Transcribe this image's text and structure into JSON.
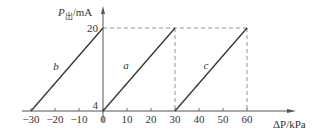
{
  "chart_data": {
    "type": "line",
    "title": "",
    "xlabel": "ΔP/kPa",
    "ylabel": "P出/mA",
    "ylabel_main": "P",
    "ylabel_sub": "出",
    "ylabel_unit": "/mA",
    "xlim": [
      -35,
      70
    ],
    "ylim": [
      4,
      20
    ],
    "x_ticks": [
      -30,
      -20,
      -10,
      0,
      10,
      20,
      30,
      40,
      50,
      60
    ],
    "x_tick_labels": [
      "−30",
      "−20",
      "−10",
      "0",
      "10",
      "20",
      "30",
      "40",
      "50",
      "60"
    ],
    "y_ticks": [
      4,
      20
    ],
    "y_tick_labels": [
      "4",
      "20"
    ],
    "grid": false,
    "reference_lines": {
      "horizontal_dashed_y": 20,
      "vertical_dashed_x": [
        30,
        60
      ]
    },
    "series": [
      {
        "name": "b",
        "x": [
          -30,
          0
        ],
        "y": [
          4,
          20
        ]
      },
      {
        "name": "a",
        "x": [
          0,
          30
        ],
        "y": [
          4,
          20
        ]
      },
      {
        "name": "c",
        "x": [
          30,
          60
        ],
        "y": [
          4,
          20
        ]
      }
    ],
    "colors": {
      "line": "#333333",
      "axis": "#555555",
      "dashed": "#888888"
    }
  }
}
